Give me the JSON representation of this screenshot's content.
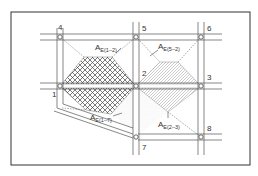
{
  "diagram": {
    "type": "road-network-catchment",
    "nodes": [
      {
        "id": "1",
        "label": "1",
        "x": 60,
        "y": 86
      },
      {
        "id": "2",
        "label": "2",
        "x": 136,
        "y": 86
      },
      {
        "id": "3",
        "label": "3",
        "x": 201,
        "y": 86
      },
      {
        "id": "4",
        "label": "4",
        "x": 60,
        "y": 37
      },
      {
        "id": "5",
        "label": "5",
        "x": 136,
        "y": 37
      },
      {
        "id": "6",
        "label": "6",
        "x": 201,
        "y": 37
      },
      {
        "id": "7",
        "label": "7",
        "x": 136,
        "y": 137
      },
      {
        "id": "8",
        "label": "8",
        "x": 201,
        "y": 137
      }
    ],
    "areas": [
      {
        "id": "AE(1-2)",
        "label_main": "A",
        "label_sub": "E(1–2)",
        "pattern": "crosshatch"
      },
      {
        "id": "AE(5-2)",
        "label_main": "A",
        "label_sub": "E(5–2)",
        "pattern": "diagonal-hatch"
      },
      {
        "id": "AE(1-7)",
        "label_main": "A",
        "label_sub": "E(1–7)",
        "pattern": "dots"
      },
      {
        "id": "AE(2-3)",
        "label_main": "A",
        "label_sub": "E(2–3)",
        "pattern": "diagonal-hatch"
      }
    ],
    "colors": {
      "line": "#555555",
      "frame": "#333333",
      "hatch": "#666666",
      "background": "#ffffff"
    }
  }
}
